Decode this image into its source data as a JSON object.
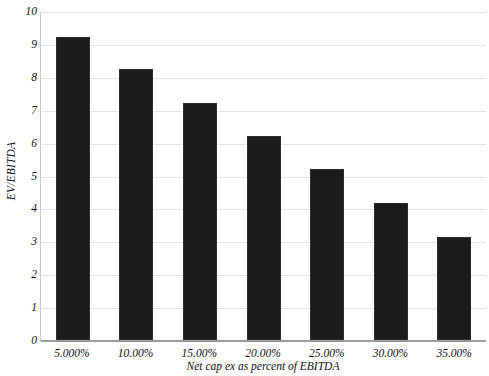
{
  "chart_data": {
    "type": "bar",
    "title": "",
    "categories": [
      "5.000%",
      "10.00%",
      "15.00%",
      "20.00%",
      "25.00%",
      "30.00%",
      "35.00%"
    ],
    "values": [
      9.2,
      8.24,
      7.2,
      6.2,
      5.2,
      4.15,
      3.13
    ],
    "xlabel": "Net cap ex as percent of EBITDA",
    "ylabel": "EV/EBITDA",
    "ylim": [
      0,
      10
    ],
    "ytick_labels": [
      "0",
      "1",
      "2",
      "3",
      "4",
      "5",
      "6",
      "7",
      "8",
      "9",
      "10"
    ],
    "ytick_values": [
      0,
      1,
      2,
      3,
      4,
      5,
      6,
      7,
      8,
      9,
      10
    ],
    "grid": true,
    "legend": "none",
    "bar_color": "#1c1c1c",
    "gridline_color": "#e3e3e8",
    "axis_color": "#9a9a9a",
    "background_color": "#ffffff"
  }
}
